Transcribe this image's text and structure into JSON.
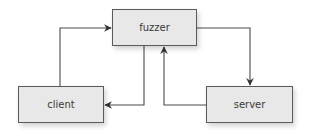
{
  "diagram": {
    "nodes": [
      {
        "id": "fuzzer",
        "label": "fuzzer"
      },
      {
        "id": "client",
        "label": "client"
      },
      {
        "id": "server",
        "label": "server"
      }
    ],
    "edges": [
      {
        "from": "client",
        "to": "fuzzer"
      },
      {
        "from": "fuzzer",
        "to": "client"
      },
      {
        "from": "server",
        "to": "fuzzer"
      },
      {
        "from": "fuzzer",
        "to": "server"
      }
    ],
    "colors": {
      "box_fill": "#e8e8e8",
      "box_border": "#5a5a5a",
      "line": "#4a4a4a",
      "text": "#3a3a3a"
    }
  }
}
